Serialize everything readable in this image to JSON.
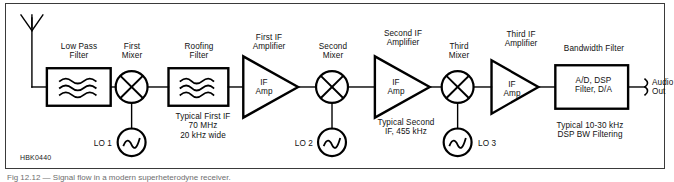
{
  "figure": {
    "id_label": "HBK0440",
    "caption": "Fig 12.12 — Signal flow in a modern superheterodyne receiver.",
    "frame_color": "#3a3a3a",
    "line_color": "#000000",
    "background": "#ffffff"
  },
  "diagram": {
    "type": "block-diagram",
    "signal_path_order": [
      "antenna",
      "low-pass-filter",
      "first-mixer",
      "roofing-filter",
      "first-if-amplifier",
      "second-mixer",
      "second-if-amplifier",
      "third-mixer",
      "third-if-amplifier",
      "bandwidth-filter",
      "audio-out"
    ],
    "blocks": [
      {
        "key": "antenna",
        "symbol": "antenna",
        "title": "",
        "inner": ""
      },
      {
        "key": "low_pass_filter",
        "symbol": "filter-box",
        "title": "Low Pass\nFilter",
        "inner": ""
      },
      {
        "key": "first_mixer",
        "symbol": "mixer-circle",
        "title": "First\nMixer",
        "inner": ""
      },
      {
        "key": "roofing_filter",
        "symbol": "filter-box",
        "title": "Roofing\nFilter",
        "inner": ""
      },
      {
        "key": "first_if_amp",
        "symbol": "amplifier-triangle",
        "title": "First IF\nAmplifier",
        "inner": "IF\nAmp"
      },
      {
        "key": "second_mixer",
        "symbol": "mixer-circle",
        "title": "Second\nMixer",
        "inner": ""
      },
      {
        "key": "second_if_amp",
        "symbol": "amplifier-triangle",
        "title": "Second IF\nAmplifier",
        "inner": "IF\nAmp"
      },
      {
        "key": "third_mixer",
        "symbol": "mixer-circle",
        "title": "Third\nMixer",
        "inner": ""
      },
      {
        "key": "third_if_amp",
        "symbol": "amplifier-triangle",
        "title": "Third IF\nAmplifier",
        "inner": "IF\nAmp"
      },
      {
        "key": "bandwidth_filter",
        "symbol": "dsp-box",
        "title": "Bandwidth Filter",
        "inner": "A/D, DSP\nFilter, D/A"
      }
    ],
    "oscillators": [
      {
        "key": "lo1",
        "symbol": "sine-oscillator",
        "label": "LO 1"
      },
      {
        "key": "lo2",
        "symbol": "sine-oscillator",
        "label": "LO 2"
      },
      {
        "key": "lo3",
        "symbol": "sine-oscillator",
        "label": "LO 3"
      }
    ],
    "annotations": [
      {
        "key": "first_if_note",
        "text": "Typical First IF\n70 MHz\n20 kHz wide"
      },
      {
        "key": "second_if_note",
        "text": "Typical Second\nIF, 455 kHz"
      },
      {
        "key": "dsp_bw_note",
        "text": "Typical 10-30 kHz\nDSP BW Filtering"
      }
    ],
    "output": {
      "key": "audio_out",
      "symbol": "jack-connector",
      "label": "Audio\nOut"
    }
  }
}
